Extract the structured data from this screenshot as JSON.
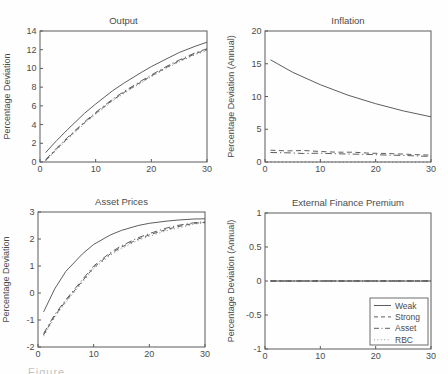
{
  "figure": {
    "caption_fragment": "Figure",
    "background": "#fefefe",
    "line_color": "#4d4d4d",
    "axis_color": "#5a5a5a",
    "text_color": "#4b4b4b",
    "legend_border_color": "#6d6d6d"
  },
  "legend": {
    "location": "lower right of External Finance Premium panel",
    "entries": [
      {
        "label": "Weak",
        "style": "solid"
      },
      {
        "label": "Strong",
        "style": "dashed"
      },
      {
        "label": "Asset",
        "style": "dashdot"
      },
      {
        "label": "RBC",
        "style": "dotted"
      }
    ]
  },
  "chart_data": [
    {
      "type": "line",
      "title": "Output",
      "xlabel": "",
      "ylabel": "Percentage Deviation",
      "xlim": [
        0,
        30
      ],
      "ylim": [
        0,
        14
      ],
      "xticks": [
        0,
        10,
        20,
        30
      ],
      "yticks": [
        0,
        2,
        4,
        6,
        8,
        10,
        12,
        14
      ],
      "grid": false,
      "series": [
        {
          "name": "Weak",
          "style": "solid",
          "x": [
            1,
            3,
            5,
            8,
            10,
            13,
            15,
            18,
            20,
            23,
            25,
            28,
            30
          ],
          "y": [
            1.0,
            2.3,
            3.5,
            5.2,
            6.2,
            7.6,
            8.4,
            9.5,
            10.2,
            11.1,
            11.7,
            12.4,
            12.8
          ]
        },
        {
          "name": "Strong",
          "style": "dashed",
          "x": [
            1,
            3,
            5,
            8,
            10,
            13,
            15,
            18,
            20,
            23,
            25,
            28,
            30
          ],
          "y": [
            0.15,
            1.4,
            2.55,
            4.2,
            5.2,
            6.6,
            7.4,
            8.5,
            9.2,
            10.2,
            10.8,
            11.6,
            12.0
          ]
        },
        {
          "name": "Asset",
          "style": "dashdot",
          "x": [
            1,
            3,
            5,
            8,
            10,
            13,
            15,
            18,
            20,
            23,
            25,
            28,
            30
          ],
          "y": [
            0.25,
            1.5,
            2.65,
            4.3,
            5.3,
            6.7,
            7.5,
            8.6,
            9.3,
            10.3,
            10.9,
            11.7,
            12.1
          ]
        },
        {
          "name": "RBC",
          "style": "dotted",
          "x": [
            1,
            3,
            5,
            8,
            10,
            13,
            15,
            18,
            20,
            23,
            25,
            28,
            30
          ],
          "y": [
            0.1,
            1.3,
            2.45,
            4.1,
            5.1,
            6.5,
            7.3,
            8.4,
            9.1,
            10.1,
            10.7,
            11.5,
            11.9
          ]
        }
      ]
    },
    {
      "type": "line",
      "title": "Inflation",
      "xlabel": "",
      "ylabel": "Percentage Deviation (Annual)",
      "xlim": [
        0,
        30
      ],
      "ylim": [
        0,
        20
      ],
      "xticks": [
        0,
        10,
        20,
        30
      ],
      "yticks": [
        0,
        5,
        10,
        15,
        20
      ],
      "grid": false,
      "series": [
        {
          "name": "Weak",
          "style": "solid",
          "x": [
            1,
            5,
            10,
            15,
            20,
            25,
            30
          ],
          "y": [
            15.6,
            13.7,
            11.8,
            10.2,
            8.9,
            7.8,
            6.9
          ]
        },
        {
          "name": "Strong",
          "style": "dashed",
          "x": [
            1,
            4,
            7,
            10,
            13,
            16,
            19,
            22,
            25,
            28,
            30
          ],
          "y": [
            1.8,
            1.7,
            1.75,
            1.6,
            1.5,
            1.5,
            1.35,
            1.3,
            1.2,
            1.1,
            1.05
          ]
        },
        {
          "name": "Asset",
          "style": "dashdot",
          "x": [
            1,
            4,
            7,
            10,
            13,
            16,
            19,
            22,
            25,
            28,
            30
          ],
          "y": [
            1.45,
            1.4,
            1.3,
            1.35,
            1.25,
            1.2,
            1.15,
            1.05,
            1.0,
            0.9,
            0.85
          ]
        },
        {
          "name": "RBC",
          "style": "dotted",
          "x": [
            1,
            30
          ],
          "y": [
            0,
            0
          ]
        }
      ]
    },
    {
      "type": "line",
      "title": "Asset Prices",
      "xlabel": "",
      "ylabel": "Percentage Deviation",
      "xlim": [
        0,
        30
      ],
      "ylim": [
        -2,
        3
      ],
      "xticks": [
        0,
        10,
        20,
        30
      ],
      "yticks": [
        -2,
        -1,
        0,
        1,
        2,
        3
      ],
      "grid": false,
      "series": [
        {
          "name": "Weak",
          "style": "solid",
          "x": [
            1,
            3,
            5,
            8,
            10,
            13,
            15,
            18,
            20,
            23,
            25,
            28,
            30
          ],
          "y": [
            -0.7,
            0.15,
            0.8,
            1.45,
            1.8,
            2.15,
            2.32,
            2.5,
            2.58,
            2.66,
            2.7,
            2.74,
            2.75
          ]
        },
        {
          "name": "Strong",
          "style": "dashed",
          "x": [
            1,
            3,
            5,
            8,
            10,
            13,
            15,
            18,
            20,
            23,
            25,
            28,
            30
          ],
          "y": [
            -1.55,
            -0.85,
            -0.3,
            0.45,
            0.95,
            1.45,
            1.7,
            2.0,
            2.15,
            2.35,
            2.45,
            2.58,
            2.62
          ]
        },
        {
          "name": "Asset",
          "style": "dashdot",
          "x": [
            1,
            3,
            5,
            8,
            10,
            13,
            15,
            18,
            20,
            23,
            25,
            28,
            30
          ],
          "y": [
            -1.5,
            -0.8,
            -0.25,
            0.5,
            1.0,
            1.5,
            1.75,
            2.05,
            2.2,
            2.4,
            2.5,
            2.6,
            2.64
          ]
        },
        {
          "name": "RBC",
          "style": "dotted",
          "x": [
            1,
            3,
            5,
            8,
            10,
            13,
            15,
            18,
            20,
            23,
            25,
            28,
            30
          ],
          "y": [
            -1.6,
            -0.9,
            -0.35,
            0.4,
            0.9,
            1.4,
            1.65,
            1.95,
            2.1,
            2.3,
            2.4,
            2.55,
            2.6
          ]
        }
      ]
    },
    {
      "type": "line",
      "title": "External Finance Premium",
      "xlabel": "",
      "ylabel": "Percentage Deviation (Annual)",
      "xlim": [
        0,
        30
      ],
      "ylim": [
        -1,
        1
      ],
      "xticks": [
        0,
        10,
        20,
        30
      ],
      "yticks": [
        -1,
        -0.5,
        0,
        0.5,
        1
      ],
      "grid": false,
      "series": [
        {
          "name": "Weak",
          "style": "solid",
          "x": [
            1,
            30
          ],
          "y": [
            0,
            0
          ]
        },
        {
          "name": "Strong",
          "style": "dashed",
          "x": [
            1,
            30
          ],
          "y": [
            0,
            0
          ]
        },
        {
          "name": "Asset",
          "style": "dashdot",
          "x": [
            1,
            30
          ],
          "y": [
            0,
            0
          ]
        },
        {
          "name": "RBC",
          "style": "dotted",
          "x": [
            1,
            30
          ],
          "y": [
            0,
            0
          ]
        }
      ]
    }
  ]
}
